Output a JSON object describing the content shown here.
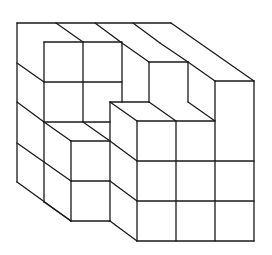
{
  "figure": {
    "type": "isometric-cube-structure",
    "description": "Stack of unit cubes drawn in oblique projection, 4x4x4 block with a stepped notch removed from the front-right",
    "stroke_color": "#1a1a1a",
    "background_color": "#ffffff",
    "grid": {
      "cube_width_px": 39,
      "cube_height_px": 40,
      "depth_dx_px": 27,
      "depth_dy_px": 19.5
    },
    "segments": [
      [
        17,
        23,
        171,
        23
      ],
      [
        17,
        23,
        17,
        182
      ],
      [
        17,
        182,
        71,
        221
      ],
      [
        17,
        63,
        44,
        82
      ],
      [
        17,
        102,
        44,
        122
      ],
      [
        17,
        143,
        44,
        162
      ],
      [
        56,
        23,
        83,
        42
      ],
      [
        95,
        23,
        122,
        43
      ],
      [
        133,
        23,
        160,
        43
      ],
      [
        171,
        23,
        254,
        81
      ],
      [
        44,
        42,
        122,
        42
      ],
      [
        44,
        42,
        44,
        202
      ],
      [
        83,
        42,
        83,
        122
      ],
      [
        122,
        43,
        122,
        102
      ],
      [
        44,
        82,
        122,
        82
      ],
      [
        122,
        43,
        149,
        62
      ],
      [
        160,
        43,
        188,
        62
      ],
      [
        149,
        62,
        188,
        62
      ],
      [
        149,
        62,
        149,
        102
      ],
      [
        188,
        62,
        188,
        102
      ],
      [
        188,
        62,
        215,
        81
      ],
      [
        215,
        81,
        254,
        81
      ],
      [
        215,
        81,
        215,
        241
      ],
      [
        254,
        81,
        254,
        241
      ],
      [
        110,
        102,
        149,
        102
      ],
      [
        110,
        102,
        110,
        221
      ],
      [
        110,
        102,
        137,
        121
      ],
      [
        149,
        102,
        176,
        121
      ],
      [
        188,
        102,
        215,
        121
      ],
      [
        137,
        121,
        215,
        121
      ],
      [
        137,
        121,
        137,
        241
      ],
      [
        176,
        121,
        176,
        241
      ],
      [
        137,
        161,
        254,
        161
      ],
      [
        137,
        201,
        254,
        201
      ],
      [
        137,
        241,
        254,
        241
      ],
      [
        44,
        122,
        110,
        122
      ],
      [
        83,
        122,
        110,
        141
      ],
      [
        44,
        122,
        71,
        141
      ],
      [
        71,
        141,
        110,
        141
      ],
      [
        71,
        141,
        71,
        221
      ],
      [
        71,
        181,
        110,
        181
      ],
      [
        71,
        221,
        110,
        221
      ],
      [
        44,
        162,
        71,
        181
      ],
      [
        44,
        202,
        71,
        221
      ],
      [
        110,
        141,
        137,
        161
      ],
      [
        110,
        181,
        137,
        201
      ],
      [
        110,
        221,
        137,
        241
      ]
    ]
  }
}
